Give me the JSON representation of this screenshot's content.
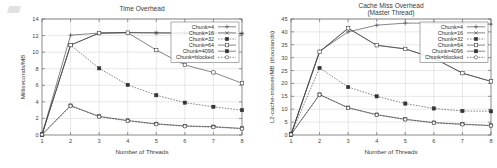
{
  "figure": {
    "background": "#ffffff",
    "ink_color": "#3a3a3a",
    "grid_color": "#c4c4c4"
  },
  "artifact": {
    "name": "scan-smudge"
  },
  "charts": [
    {
      "id": "time-overhead",
      "title": "Time Overhead",
      "xlabel": "Number of Threads",
      "ylabel": "Milliseconds/MB",
      "xticks": [
        "1",
        "2",
        "3",
        "4",
        "5",
        "6",
        "7",
        "8"
      ],
      "yticks": [
        "0",
        "2",
        "4",
        "6",
        "8",
        "10",
        "12",
        "14"
      ],
      "legend_position": "top-right"
    },
    {
      "id": "cache-miss-overhead",
      "title": "Cache Miss Overhead",
      "subtitle": "(Master Thread)",
      "xlabel": "Number of Threads",
      "ylabel": "L2-cache-misses/MB (thousands)",
      "xticks": [
        "1",
        "2",
        "3",
        "4",
        "5",
        "6",
        "7",
        "8"
      ],
      "yticks": [
        "0",
        "5",
        "10",
        "15",
        "20",
        "25",
        "30",
        "35",
        "40",
        "45"
      ],
      "legend_position": "top-right"
    }
  ],
  "chart_data": [
    {
      "type": "line",
      "title": "Time Overhead",
      "subtitle": "",
      "xlabel": "Number of Threads",
      "ylabel": "Milliseconds/MB",
      "x": [
        1,
        2,
        3,
        4,
        5,
        6,
        7,
        8
      ],
      "xlim": [
        1,
        8
      ],
      "ylim": [
        0,
        14
      ],
      "xticks": [
        1,
        2,
        3,
        4,
        5,
        6,
        7,
        8
      ],
      "yticks": [
        0,
        2,
        4,
        6,
        8,
        10,
        12,
        14
      ],
      "grid": true,
      "legend": [
        "Chunk=4",
        "Chunk=16",
        "Chunk=32",
        "Chunk=64",
        "Chunk=4096",
        "Chunk=blocked"
      ],
      "legend_position": "top-right",
      "series": [
        {
          "name": "Chunk=4",
          "marker": "plus",
          "values": [
            0.05,
            12.05,
            12.3,
            12.35,
            12.35,
            12.3,
            12.3,
            12.25
          ]
        },
        {
          "name": "Chunk=16",
          "marker": "cross",
          "values": [
            0.05,
            10.85,
            12.3,
            12.35,
            12.3,
            12.3,
            12.3,
            12.25
          ]
        },
        {
          "name": "Chunk=32",
          "marker": "filled-square",
          "values": [
            0.05,
            10.85,
            8.05,
            6.05,
            4.8,
            3.9,
            3.4,
            3.0
          ]
        },
        {
          "name": "Chunk=64",
          "marker": "open-square",
          "values": [
            0.05,
            10.85,
            12.3,
            12.35,
            10.25,
            8.45,
            7.55,
            6.25
          ]
        },
        {
          "name": "Chunk=4096",
          "marker": "filled-square",
          "values": [
            0.05,
            3.55,
            2.25,
            1.75,
            1.35,
            1.1,
            1.0,
            0.8
          ]
        },
        {
          "name": "Chunk=blocked",
          "marker": "open-circle",
          "values": [
            0.05,
            3.5,
            2.2,
            1.7,
            1.3,
            1.05,
            0.95,
            0.75
          ]
        }
      ]
    },
    {
      "type": "line",
      "title": "Cache Miss Overhead",
      "subtitle": "(Master Thread)",
      "xlabel": "Number of Threads",
      "ylabel": "L2-cache-misses/MB (thousands)",
      "x": [
        1,
        2,
        3,
        4,
        5,
        6,
        7,
        8
      ],
      "xlim": [
        1,
        8
      ],
      "ylim": [
        0,
        45
      ],
      "xticks": [
        1,
        2,
        3,
        4,
        5,
        6,
        7,
        8
      ],
      "yticks": [
        0,
        5,
        10,
        15,
        20,
        25,
        30,
        35,
        40,
        45
      ],
      "grid": true,
      "legend": [
        "Chunk=4",
        "Chunk=16",
        "Chunk=32",
        "Chunk=64",
        "Chunk=4096",
        "Chunk=blocked"
      ],
      "legend_position": "top-right",
      "series": [
        {
          "name": "Chunk=4",
          "marker": "plus",
          "values": [
            0.2,
            32.5,
            40.0,
            42.6,
            43.4,
            43.4,
            43.2,
            43.0
          ]
        },
        {
          "name": "Chunk=16",
          "marker": "cross",
          "values": [
            0.2,
            32.3,
            41.4,
            34.8,
            33.4,
            29.8,
            24.0,
            20.8
          ]
        },
        {
          "name": "Chunk=32",
          "marker": "filled-square",
          "values": [
            0.2,
            26.0,
            18.6,
            15.0,
            12.2,
            10.3,
            9.3,
            9.2
          ]
        },
        {
          "name": "Chunk=64",
          "marker": "open-square",
          "values": [
            0.2,
            32.3,
            41.4,
            34.8,
            33.4,
            29.8,
            24.0,
            20.8
          ]
        },
        {
          "name": "Chunk=4096",
          "marker": "filled-square",
          "values": [
            0.2,
            15.7,
            10.6,
            7.9,
            6.1,
            4.8,
            4.2,
            3.7
          ]
        },
        {
          "name": "Chunk=blocked",
          "marker": "open-circle",
          "values": [
            0.2,
            15.6,
            10.5,
            7.8,
            6.0,
            4.7,
            4.1,
            3.6
          ]
        }
      ]
    }
  ]
}
